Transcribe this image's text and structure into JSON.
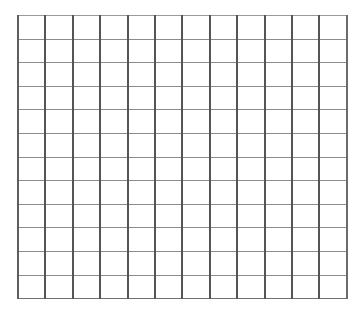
{
  "page": {
    "background_color": "#ffffff",
    "width_px": 341,
    "height_px": 309
  },
  "grid": {
    "name": "blank-graph-paper-grid",
    "columns": 12,
    "rows": 12,
    "total_cells": 144,
    "cell_width_px": 25.4,
    "cell_height_px": 22.6,
    "origin_x_px": 17,
    "origin_y_px": 15,
    "width_px": 305,
    "height_px": 271,
    "vertical_line_color": "#555555",
    "vertical_line_width_px": 2,
    "horizontal_line_color": "#8c8c8c",
    "horizontal_line_width_px": 1,
    "cell_fill_color": "#ffffff",
    "cell_label": "",
    "column_headers": [
      "",
      "",
      "",
      "",
      "",
      "",
      "",
      "",
      "",
      "",
      "",
      ""
    ],
    "row_headers": [
      "",
      "",
      "",
      "",
      "",
      "",
      "",
      "",
      "",
      "",
      "",
      ""
    ],
    "cells": [
      [
        "",
        "",
        "",
        "",
        "",
        "",
        "",
        "",
        "",
        "",
        "",
        ""
      ],
      [
        "",
        "",
        "",
        "",
        "",
        "",
        "",
        "",
        "",
        "",
        "",
        ""
      ],
      [
        "",
        "",
        "",
        "",
        "",
        "",
        "",
        "",
        "",
        "",
        "",
        ""
      ],
      [
        "",
        "",
        "",
        "",
        "",
        "",
        "",
        "",
        "",
        "",
        "",
        ""
      ],
      [
        "",
        "",
        "",
        "",
        "",
        "",
        "",
        "",
        "",
        "",
        "",
        ""
      ],
      [
        "",
        "",
        "",
        "",
        "",
        "",
        "",
        "",
        "",
        "",
        "",
        ""
      ],
      [
        "",
        "",
        "",
        "",
        "",
        "",
        "",
        "",
        "",
        "",
        "",
        ""
      ],
      [
        "",
        "",
        "",
        "",
        "",
        "",
        "",
        "",
        "",
        "",
        "",
        ""
      ],
      [
        "",
        "",
        "",
        "",
        "",
        "",
        "",
        "",
        "",
        "",
        "",
        ""
      ],
      [
        "",
        "",
        "",
        "",
        "",
        "",
        "",
        "",
        "",
        "",
        "",
        ""
      ],
      [
        "",
        "",
        "",
        "",
        "",
        "",
        "",
        "",
        "",
        "",
        "",
        ""
      ],
      [
        "",
        "",
        "",
        "",
        "",
        "",
        "",
        "",
        "",
        "",
        "",
        ""
      ]
    ]
  }
}
